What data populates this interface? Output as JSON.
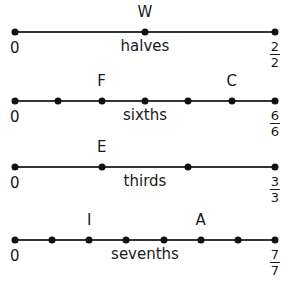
{
  "lines": [
    {
      "name": "halves",
      "denominator": 2,
      "y": 32,
      "end_label": {
        "numerator": "2",
        "denominator": "2"
      },
      "start_label": "0",
      "labeled_points": [
        {
          "letter": "W",
          "numerator": 1
        }
      ]
    },
    {
      "name": "sixths",
      "denominator": 6,
      "y": 101,
      "end_label": {
        "numerator": "6",
        "denominator": "6"
      },
      "start_label": "0",
      "labeled_points": [
        {
          "letter": "F",
          "numerator": 2
        },
        {
          "letter": "C",
          "numerator": 5
        }
      ]
    },
    {
      "name": "thirds",
      "denominator": 3,
      "y": 167,
      "end_label": {
        "numerator": "3",
        "denominator": "3"
      },
      "start_label": "0",
      "labeled_points": [
        {
          "letter": "E",
          "numerator": 1
        }
      ]
    },
    {
      "name": "sevenths",
      "denominator": 7,
      "y": 240,
      "end_label": {
        "numerator": "7",
        "denominator": "7"
      },
      "start_label": "0",
      "labeled_points": [
        {
          "letter": "I",
          "numerator": 2
        },
        {
          "letter": "A",
          "numerator": 5
        }
      ]
    }
  ],
  "colors": {
    "line": "#333333",
    "dot": "#111111",
    "text": "#1a1a1a"
  }
}
